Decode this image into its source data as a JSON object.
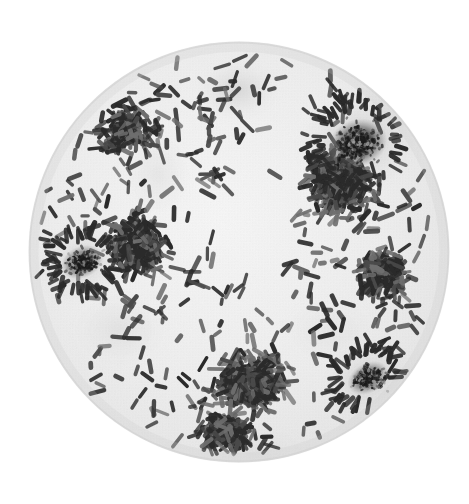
{
  "figure": {
    "kind": "photomicrograph",
    "caption": "",
    "medium": "halftone printed monochrome plate",
    "field_shape": "circular microscope field of view"
  },
  "canvas": {
    "width": 469,
    "height": 504,
    "background": "#ffffff"
  },
  "field": {
    "center_x": 239,
    "center_y": 252,
    "radius": 211,
    "interior_color": "#ededed",
    "interior_color_light": "#f4f4f4",
    "edge_color": "#dcdcdc",
    "outside_color": "#ffffff"
  },
  "palette": {
    "bacillus_dark": "#2a2a2a",
    "bacillus_mid": "#4a4a4a",
    "bacillus_light": "#6e6e6e",
    "colony_core": "#1b1b1b",
    "colony_halo": "#9a9a9a",
    "smudge": "#c9c9c9"
  },
  "morphology": {
    "cell_shape": "rod",
    "cell_length_px_min": 9,
    "cell_length_px_max": 19,
    "cell_width_px_min": 3.2,
    "cell_width_px_max": 5.0,
    "orientation": "random",
    "arrangement": "scattered singles, pairs and short chains"
  },
  "colonies": [
    {
      "name": "upper-right-aggregate",
      "cx": 358,
      "cy": 143,
      "rx": 30,
      "ry": 24,
      "rotation": -18,
      "darkness": 0.97,
      "halo_rx": 62,
      "halo_ry": 50
    },
    {
      "name": "left-center-aggregate",
      "cx": 82,
      "cy": 262,
      "rx": 22,
      "ry": 16,
      "rotation": -25,
      "darkness": 0.8,
      "halo_rx": 46,
      "halo_ry": 38
    },
    {
      "name": "lower-right-aggregate",
      "cx": 368,
      "cy": 378,
      "rx": 22,
      "ry": 15,
      "rotation": -30,
      "darkness": 0.74,
      "halo_rx": 48,
      "halo_ry": 34
    }
  ],
  "smudges": [
    {
      "name": "top-center-smudge",
      "cx": 238,
      "cy": 90,
      "rx": 42,
      "ry": 30,
      "opacity": 0.3
    },
    {
      "name": "center-clear-zone",
      "cx": 243,
      "cy": 232,
      "rx": 52,
      "ry": 46,
      "opacity": 0.0
    },
    {
      "name": "lower-left-shadow",
      "cx": 120,
      "cy": 330,
      "rx": 48,
      "ry": 38,
      "opacity": 0.14
    },
    {
      "name": "mid-left-shadow",
      "cx": 158,
      "cy": 175,
      "rx": 34,
      "ry": 40,
      "opacity": 0.12
    }
  ],
  "density_zones": [
    {
      "name": "upper-right-dense",
      "cx": 340,
      "cy": 180,
      "rx": 95,
      "ry": 95,
      "count": 330
    },
    {
      "name": "lower-center-dense",
      "cx": 250,
      "cy": 380,
      "rx": 100,
      "ry": 85,
      "count": 260
    },
    {
      "name": "left-mid-dense",
      "cx": 135,
      "cy": 245,
      "rx": 85,
      "ry": 90,
      "count": 210
    },
    {
      "name": "upper-left-sparse",
      "cx": 130,
      "cy": 130,
      "rx": 80,
      "ry": 75,
      "count": 110
    },
    {
      "name": "right-mid-moderate",
      "cx": 385,
      "cy": 275,
      "rx": 70,
      "ry": 85,
      "count": 150
    },
    {
      "name": "bottom-swarm",
      "cx": 225,
      "cy": 430,
      "rx": 70,
      "ry": 50,
      "count": 160
    },
    {
      "name": "general-scatter",
      "cx": 239,
      "cy": 252,
      "rx": 205,
      "ry": 205,
      "count": 300
    }
  ],
  "texture": {
    "halftone": true,
    "halftone_pitch_px": 3,
    "halftone_opacity": 0.07,
    "grain_opacity": 0.05
  }
}
